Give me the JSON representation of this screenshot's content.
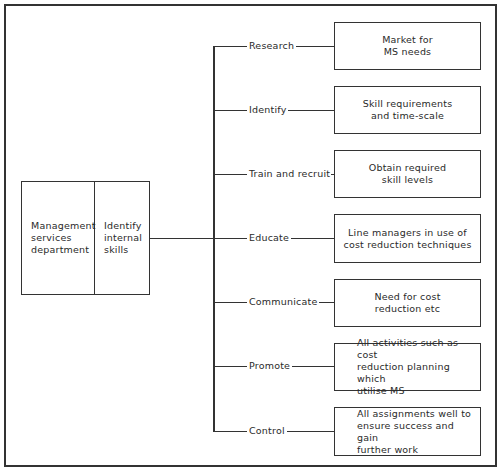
{
  "root": {
    "left_label": "Management\nservices\ndepartment",
    "right_label": "Identify\ninternal\nskills"
  },
  "branches": [
    {
      "label": "Research",
      "target": "Market for\nMS needs",
      "align": "center"
    },
    {
      "label": "Identify",
      "target": "Skill requirements\nand time-scale",
      "align": "center"
    },
    {
      "label": "Train and recruit",
      "target": "Obtain required\nskill levels",
      "align": "center"
    },
    {
      "label": "Educate",
      "target": "Line managers in use of\ncost reduction techniques",
      "align": "center"
    },
    {
      "label": "Communicate",
      "target": "Need for cost\nreduction etc",
      "align": "center"
    },
    {
      "label": "Promote",
      "target": "All activities such as cost\nreduction planning which\nutilise MS",
      "align": "left"
    },
    {
      "label": "Control",
      "target": "All assignments well to\nensure success and gain\nfurther work",
      "align": "left"
    }
  ]
}
